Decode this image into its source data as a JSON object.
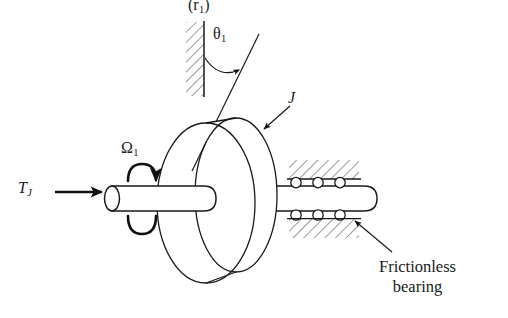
{
  "figure": {
    "background_color": "#ffffff",
    "stroke_color": "#1a1a1a",
    "hatch_color": "#3a3a3a",
    "width": 508,
    "height": 318
  },
  "labels": {
    "radius": {
      "text": "(r1)",
      "base": "(r",
      "sub": "1",
      "close": ")",
      "name": "radius-parenthetical-label",
      "x": 188,
      "y": -3
    },
    "theta": {
      "text": "theta-1",
      "glyph": "θ",
      "sub": "1",
      "name": "angular-displacement-label",
      "x": 213,
      "y": 26
    },
    "inertia": {
      "text": "J",
      "name": "inertia-label",
      "x": 288,
      "y": 90
    },
    "omega": {
      "text": "Omega-1",
      "glyph": "Ω",
      "sub": "1",
      "name": "angular-velocity-label",
      "x": 121,
      "y": 140
    },
    "torque": {
      "text": "T_J",
      "base": "T",
      "sub": "J",
      "name": "applied-torque-label",
      "x": 18,
      "y": 180
    },
    "bearing": {
      "line1": "Frictionless",
      "line2": "bearing",
      "name": "frictionless-bearing-callout",
      "x": 379,
      "y": 257
    }
  },
  "components": {
    "wall": {
      "name": "fixed-wall-reference",
      "x": 204,
      "y_top": 22,
      "y_bottom": 96,
      "hatch_side": "left"
    },
    "disc": {
      "name": "flywheel-disc",
      "front_cx": 206,
      "front_cy": 203,
      "front_rx": 49,
      "front_ry": 80,
      "back_cx": 236,
      "back_cy": 195,
      "back_rx": 41,
      "back_ry": 77
    },
    "left_shaft": {
      "name": "input-shaft",
      "x_start": 106,
      "x_end": 216,
      "y_top": 186,
      "y_bottom": 211
    },
    "right_shaft": {
      "name": "output-shaft",
      "x_start": 250,
      "x_end": 377,
      "y_top": 186,
      "y_bottom": 211
    },
    "bearing_top": {
      "name": "bearing-block-top",
      "x_start": 288,
      "x_end": 362,
      "ball_count": 3
    },
    "bearing_bottom": {
      "name": "bearing-block-bottom",
      "x_start": 288,
      "x_end": 362,
      "ball_count": 3
    },
    "tilt_line": {
      "name": "radius-tilt-line",
      "x1": 258,
      "y1": 35,
      "x2": 193,
      "y2": 170
    },
    "theta_arc": {
      "name": "theta-angle-arc"
    },
    "omega_arrow": {
      "name": "rotation-direction-arrow"
    },
    "torque_arrow": {
      "name": "torque-direction-arrow"
    },
    "bearing_leader": {
      "name": "bearing-leader-line"
    },
    "inertia_leader": {
      "name": "inertia-leader-line"
    }
  }
}
